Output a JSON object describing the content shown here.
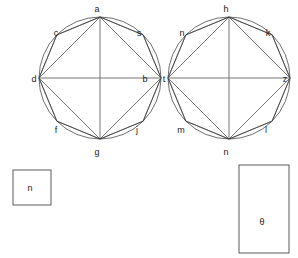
{
  "figure": {
    "title": "",
    "background_color": "#ffffff",
    "stroke_color": "#3a3a3a"
  },
  "shapes": {
    "left_circle": {
      "name": "left-polygon-circle",
      "center": [
        100,
        78
      ],
      "radius": 61,
      "vertices": [
        {
          "id": "a",
          "label": "a",
          "angle_deg": 90,
          "label_x": 97,
          "label_y": 12
        },
        {
          "id": "s",
          "label": "s",
          "angle_deg": 45,
          "label_x": 139,
          "label_y": 36
        },
        {
          "id": "b",
          "label": "b",
          "angle_deg": 0,
          "label_x": 145,
          "label_y": 82
        },
        {
          "id": "j",
          "label": "j",
          "angle_deg": -45,
          "label_x": 137,
          "label_y": 133
        },
        {
          "id": "g",
          "label": "g",
          "angle_deg": -90,
          "label_x": 97,
          "label_y": 155
        },
        {
          "id": "f",
          "label": "f",
          "angle_deg": -135,
          "label_x": 56,
          "label_y": 133
        },
        {
          "id": "d",
          "label": "d",
          "angle_deg": 180,
          "label_x": 34,
          "label_y": 82
        },
        {
          "id": "c",
          "label": "c",
          "angle_deg": 135,
          "label_x": 56,
          "label_y": 36
        }
      ],
      "diameter": [
        "d",
        "b"
      ],
      "chords": [
        [
          "a",
          "c"
        ],
        [
          "a",
          "s"
        ],
        [
          "a",
          "d"
        ],
        [
          "a",
          "b"
        ],
        [
          "a",
          "g"
        ],
        [
          "c",
          "d"
        ],
        [
          "s",
          "b"
        ],
        [
          "d",
          "f"
        ],
        [
          "b",
          "j"
        ],
        [
          "f",
          "g"
        ],
        [
          "j",
          "g"
        ],
        [
          "d",
          "g"
        ],
        [
          "b",
          "g"
        ]
      ]
    },
    "right_circle": {
      "name": "right-polygon-circle",
      "center": [
        229,
        78
      ],
      "radius": 61,
      "vertices": [
        {
          "id": "h",
          "label": "h",
          "angle_deg": 90,
          "label_x": 226,
          "label_y": 12
        },
        {
          "id": "k",
          "label": "k",
          "angle_deg": 45,
          "label_x": 268,
          "label_y": 36
        },
        {
          "id": "z",
          "label": "z",
          "angle_deg": 0,
          "label_x": 285,
          "label_y": 82
        },
        {
          "id": "l",
          "label": "l",
          "angle_deg": -45,
          "label_x": 266,
          "label_y": 133
        },
        {
          "id": "n2",
          "label": "n",
          "angle_deg": -90,
          "label_x": 226,
          "label_y": 155
        },
        {
          "id": "m",
          "label": "m",
          "angle_deg": -135,
          "label_x": 181,
          "label_y": 133
        },
        {
          "id": "t",
          "label": "t",
          "angle_deg": 180,
          "label_x": 164,
          "label_y": 82
        },
        {
          "id": "n1",
          "label": "n",
          "angle_deg": 135,
          "label_x": 182,
          "label_y": 36
        }
      ],
      "diameter": [
        "t",
        "z"
      ],
      "chords": [
        [
          "h",
          "n1"
        ],
        [
          "h",
          "k"
        ],
        [
          "h",
          "t"
        ],
        [
          "h",
          "z"
        ],
        [
          "h",
          "n2"
        ],
        [
          "n1",
          "t"
        ],
        [
          "k",
          "z"
        ],
        [
          "t",
          "m"
        ],
        [
          "z",
          "l"
        ],
        [
          "m",
          "n2"
        ],
        [
          "l",
          "n2"
        ],
        [
          "t",
          "n2"
        ],
        [
          "z",
          "n2"
        ]
      ]
    },
    "left_rect": {
      "name": "left-rectangle",
      "x": 13,
      "y": 170,
      "width": 38,
      "height": 35,
      "label": "n",
      "label_x": 30,
      "label_y": 191
    },
    "right_rect": {
      "name": "right-rectangle",
      "x": 239,
      "y": 165,
      "width": 50,
      "height": 88,
      "label": "θ",
      "label_x": 262,
      "label_y": 225
    }
  }
}
